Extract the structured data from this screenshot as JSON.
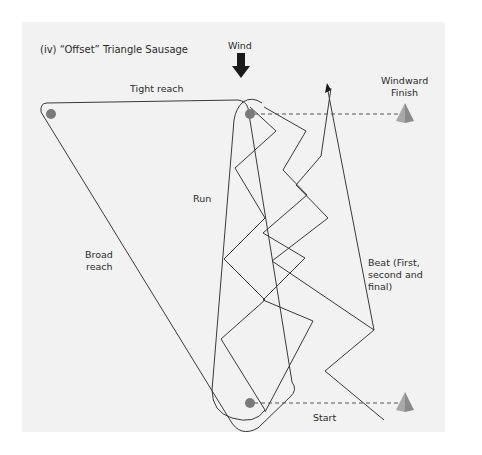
{
  "diagram": {
    "title": "(iv) “Offset” Triangle Sausage",
    "wind_label": "Wind",
    "legs": {
      "tight_reach": "Tight reach",
      "broad_reach": "Broad reach",
      "broad_reach_line1": "Broad",
      "broad_reach_line2": "reach",
      "run": "Run",
      "beat": "Beat (First, second and final)",
      "beat_line1": "Beat (First,",
      "beat_line2": "second and",
      "beat_line3": "final)"
    },
    "marks": {
      "windward_finish": "Windward Finish",
      "windward_finish_line1": "Windward",
      "windward_finish_line2": "Finish",
      "start": "Start"
    },
    "colors": {
      "panel_bg": "#f2f2f2",
      "line": "#3a3a3a",
      "buoy": "#7a7a7a",
      "cone_light": "#a8a8a8",
      "cone_dark": "#8a8a8a",
      "wind_arrow": "#1a1a1a"
    }
  }
}
